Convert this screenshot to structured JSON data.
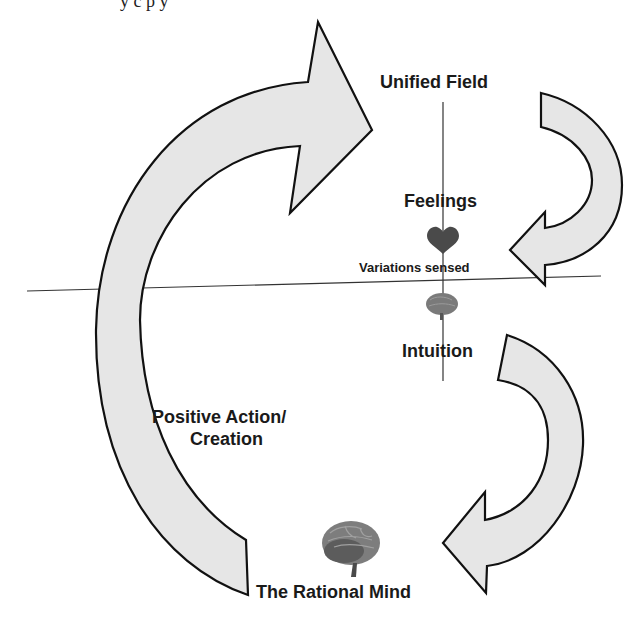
{
  "header": {
    "cut_text": "y  c      p            y"
  },
  "diagram": {
    "title": "",
    "nodes": {
      "unified_field": "Unified Field",
      "feelings": "Feelings",
      "variations_sensed": "Variations sensed",
      "intuition": "Intuition",
      "positive_action": "Positive Action/",
      "creation": "Creation",
      "rational_mind": "The Rational Mind"
    },
    "icons": {
      "heart": "heart-icon",
      "small_brain": "brain-icon",
      "large_brain": "brain-icon"
    },
    "colors": {
      "arrow_fill": "#e6e6e6",
      "arrow_stroke": "#111111",
      "line": "#333333",
      "text": "#1a1a1a",
      "heart": "#4a4a4a",
      "brain": "#6e6e6e"
    }
  }
}
